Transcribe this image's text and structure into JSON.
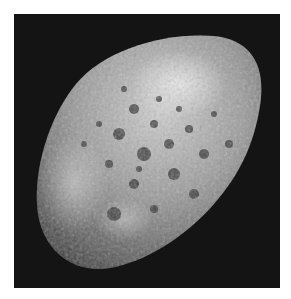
{
  "image": {
    "subject": "Hyperion (moon of Saturn), cratered sponge-like surface",
    "alt": "Grayscale photo of a heavily cratered, irregular, sponge-like moon against a black background",
    "colors": {
      "page_background": "#ffffff",
      "space_background": "#141414",
      "surface_light": "#d8d8d8",
      "surface_mid": "#8a8a8a",
      "surface_dark": "#3a3a3a"
    }
  }
}
